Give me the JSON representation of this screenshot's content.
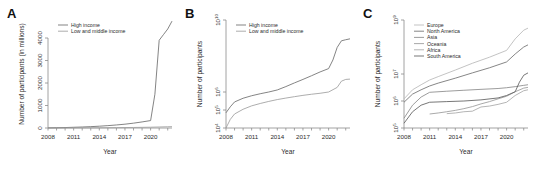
{
  "figure": {
    "panels": [
      "A",
      "B",
      "C"
    ],
    "shared_xlabel": "Year",
    "xticks": [
      "2008",
      "2011",
      "2014",
      "2017",
      "2020"
    ]
  },
  "panel_a": {
    "letter": "A",
    "ylabel": "Number of participants (in millions)",
    "xlabel": "Year",
    "yticks": [
      "0",
      "1000",
      "2000",
      "3000",
      "4000"
    ],
    "legend": [
      "High income",
      "Low and middle income"
    ]
  },
  "panel_b": {
    "letter": "B",
    "ylabel": "Number of participants",
    "xlabel": "Year",
    "yticks": [
      "10",
      "10",
      "10",
      "10"
    ],
    "yticks_exp": [
      "4",
      "5",
      "6",
      "10"
    ],
    "legend": [
      "High income",
      "Low and middle income"
    ]
  },
  "panel_c": {
    "letter": "C",
    "ylabel": "Number of participants",
    "xlabel": "Year",
    "yticks": [
      "10",
      "10",
      "10",
      "10"
    ],
    "yticks_exp": [
      "5",
      "6",
      "7",
      "9"
    ],
    "legend": [
      "Europe",
      "North America",
      "Asia",
      "Oceania",
      "Africa",
      "South America"
    ]
  },
  "colors": {
    "high_income": "#6e6e6e",
    "low_middle_income": "#9e9e9e",
    "europe": "#b8b8b8",
    "north_america": "#707070",
    "asia": "#8a8a8a",
    "oceania": "#9a9a9a",
    "africa": "#a8a8a8",
    "south_america": "#5f5f5f",
    "axis": "#8c8c8c",
    "text": "#2b2b2b"
  },
  "chart_data": [
    {
      "type": "line",
      "panel": "A",
      "title": "A",
      "xlabel": "Year",
      "ylabel": "Number of participants (in millions)",
      "xlim": [
        2008,
        2022.5
      ],
      "ylim": [
        0,
        4800
      ],
      "ytick_values": [
        0,
        1000,
        2000,
        3000,
        4000
      ],
      "xtick_values": [
        2008,
        2011,
        2014,
        2017,
        2020
      ],
      "grid": false,
      "legend_position": "top-left",
      "series": [
        {
          "name": "High income",
          "color": "#6e6e6e",
          "x": [
            2008,
            2009,
            2010,
            2011,
            2012,
            2013,
            2014,
            2015,
            2016,
            2017,
            2018,
            2019,
            2020,
            2020.5,
            2021,
            2021.5,
            2022,
            2022.5
          ],
          "values": [
            5,
            12,
            20,
            32,
            45,
            60,
            80,
            105,
            135,
            170,
            215,
            270,
            330,
            1500,
            3900,
            4150,
            4400,
            4750
          ]
        },
        {
          "name": "Low and middle income",
          "color": "#9e9e9e",
          "x": [
            2008,
            2010,
            2012,
            2014,
            2016,
            2018,
            2020,
            2021,
            2022,
            2022.5
          ],
          "values": [
            1,
            3,
            6,
            10,
            16,
            24,
            35,
            45,
            55,
            60
          ]
        }
      ]
    },
    {
      "type": "line",
      "panel": "B",
      "title": "B",
      "xlabel": "Year",
      "ylabel": "Number of participants",
      "yscale": "log",
      "xlim": [
        2008,
        2022.5
      ],
      "ylim": [
        10000,
        10000000000
      ],
      "ytick_values": [
        10000,
        100000,
        1000000,
        10000000000
      ],
      "ytick_labels": [
        "10^4",
        "10^5",
        "10^6",
        "10^10"
      ],
      "xtick_values": [
        2008,
        2011,
        2014,
        2017,
        2020
      ],
      "grid": false,
      "legend_position": "top-left",
      "series": [
        {
          "name": "High income",
          "color": "#6e6e6e",
          "x": [
            2008,
            2008.5,
            2009,
            2010,
            2011,
            2012,
            2013,
            2014,
            2015,
            2016,
            2017,
            2018,
            2019,
            2020,
            2020.5,
            2021,
            2021.5,
            2022,
            2022.5
          ],
          "values": [
            70000,
            150000,
            280000,
            450000,
            620000,
            800000,
            1000000,
            1300000,
            2000000,
            3200000,
            5000000,
            8000000,
            13000000,
            20000000,
            60000000,
            300000000,
            700000000,
            800000000,
            900000000
          ]
        },
        {
          "name": "Low and middle income",
          "color": "#9e9e9e",
          "x": [
            2008,
            2008.5,
            2009,
            2010,
            2011,
            2012,
            2013,
            2014,
            2015,
            2016,
            2017,
            2018,
            2019,
            2020,
            2021,
            2021.5,
            2022,
            2022.5
          ],
          "values": [
            10000,
            30000,
            60000,
            110000,
            170000,
            230000,
            300000,
            380000,
            460000,
            550000,
            650000,
            750000,
            850000,
            1000000,
            1800000,
            4000000,
            5000000,
            5200000
          ]
        }
      ]
    },
    {
      "type": "line",
      "panel": "C",
      "title": "C",
      "xlabel": "Year",
      "ylabel": "Number of participants",
      "yscale": "log",
      "xlim": [
        2008,
        2022.5
      ],
      "ylim": [
        100000,
        1000000000
      ],
      "ytick_values": [
        100000,
        1000000,
        10000000,
        1000000000
      ],
      "ytick_labels": [
        "10^5",
        "10^6",
        "10^7",
        "10^9"
      ],
      "xtick_values": [
        2008,
        2011,
        2014,
        2017,
        2020
      ],
      "grid": false,
      "legend_position": "top-left",
      "series": [
        {
          "name": "Europe",
          "color": "#b8b8b8",
          "x": [
            2008,
            2009,
            2010,
            2011,
            2012,
            2014,
            2016,
            2018,
            2020,
            2021,
            2022,
            2022.5
          ],
          "values": [
            1200000,
            2600000,
            4000000,
            6000000,
            8000000,
            14000000,
            25000000,
            42000000,
            75000000,
            200000000,
            420000000,
            500000000
          ]
        },
        {
          "name": "North America",
          "color": "#707070",
          "x": [
            2008,
            2009,
            2010,
            2011,
            2012,
            2014,
            2016,
            2018,
            2020,
            2021,
            2022,
            2022.5
          ],
          "values": [
            900000,
            1800000,
            2600000,
            3600000,
            4600000,
            7000000,
            11000000,
            17000000,
            28000000,
            55000000,
            100000000,
            120000000
          ]
        },
        {
          "name": "Asia",
          "color": "#8a8a8a",
          "x": [
            2008,
            2009,
            2010,
            2011,
            2013,
            2015,
            2017,
            2019,
            2020,
            2021,
            2022,
            2022.5
          ],
          "values": [
            230000,
            700000,
            1400000,
            2100000,
            2300000,
            2500000,
            2700000,
            2900000,
            3100000,
            3400000,
            3800000,
            4000000
          ]
        },
        {
          "name": "Oceania",
          "color": "#9a9a9a",
          "x": [
            2011,
            2012,
            2013,
            2014,
            2015,
            2016,
            2017,
            2018,
            2019,
            2020,
            2021,
            2022,
            2022.5
          ],
          "values": [
            330000,
            360000,
            400000,
            450000,
            520000,
            620000,
            780000,
            950000,
            1200000,
            1500000,
            2200000,
            3000000,
            3200000
          ]
        },
        {
          "name": "Africa",
          "color": "#a8a8a8",
          "x": [
            2013,
            2014,
            2015,
            2016,
            2017,
            2018,
            2019,
            2020,
            2021,
            2022,
            2022.5
          ],
          "values": [
            340000,
            360000,
            400000,
            420000,
            600000,
            650000,
            750000,
            900000,
            1600000,
            2400000,
            2600000
          ]
        },
        {
          "name": "South America",
          "color": "#5f5f5f",
          "x": [
            2008,
            2009,
            2010,
            2011,
            2013,
            2015,
            2017,
            2019,
            2020,
            2021,
            2021.5,
            2022,
            2022.5
          ],
          "values": [
            150000,
            400000,
            700000,
            900000,
            950000,
            1000000,
            1100000,
            1300000,
            1600000,
            2200000,
            5000000,
            9000000,
            11000000
          ]
        }
      ]
    }
  ]
}
